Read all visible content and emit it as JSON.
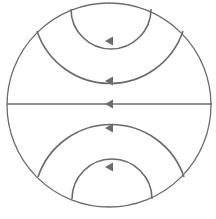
{
  "diagram": {
    "colors": {
      "stroke": "#6b6b6b",
      "background": "#ffffff"
    },
    "circle": {
      "cx": 109,
      "cy": 105,
      "r": 102
    },
    "lines": [
      {
        "name": "top-inner-arc",
        "d": "M71,9 A38,38 0 0 0 151,9",
        "arrow": {
          "x": 111,
          "y": 41
        }
      },
      {
        "name": "top-outer-arc",
        "d": "M37,31 A77,77 0 0 0 183,31",
        "arrow": {
          "x": 111,
          "y": 81
        }
      },
      {
        "name": "center-line",
        "d": "M7,104 L212,104",
        "arrow": {
          "x": 111,
          "y": 104
        }
      },
      {
        "name": "bottom-outer-arc",
        "d": "M38,177 A77,77 0 0 1 184,177",
        "arrow": {
          "x": 111,
          "y": 128
        }
      },
      {
        "name": "bottom-inner-arc",
        "d": "M72,199 A38,38 0 0 1 152,199",
        "arrow": {
          "x": 111,
          "y": 167
        }
      }
    ]
  }
}
